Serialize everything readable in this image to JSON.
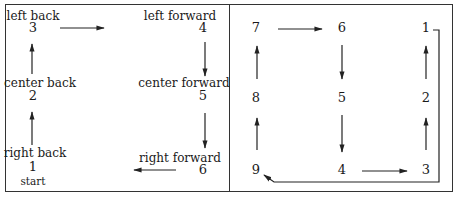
{
  "left_panel": {
    "positions": [
      {
        "number": "3",
        "label": "left back"
      },
      {
        "number": "4",
        "label": "left forward"
      },
      {
        "number": "2",
        "label": "center back"
      },
      {
        "number": "5",
        "label": "center forward"
      },
      {
        "number": "1",
        "label": "right back",
        "sublabel": "start"
      },
      {
        "number": "6",
        "label": "right forward"
      }
    ]
  },
  "right_panel": {
    "positions": [
      {
        "number": "7"
      },
      {
        "number": "6"
      },
      {
        "number": "1"
      },
      {
        "number": "8"
      },
      {
        "number": "5"
      },
      {
        "number": "2"
      },
      {
        "number": "9"
      },
      {
        "number": "4"
      },
      {
        "number": "3"
      }
    ]
  },
  "colors": {
    "line": "#333333",
    "text": "#1a1a1a",
    "background": "#ffffff"
  }
}
